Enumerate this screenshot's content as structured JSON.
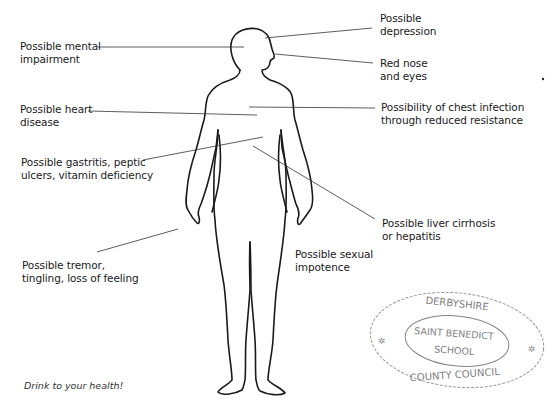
{
  "figure": {
    "line_color": "#1a1a1a",
    "leader_color": "#333333"
  },
  "labels": {
    "mental": [
      "Possible mental",
      "impairment"
    ],
    "depression": [
      "Possible",
      "depression"
    ],
    "nose": [
      "Red nose",
      "and eyes"
    ],
    "heart": [
      "Possible heart",
      "disease"
    ],
    "chest": [
      "Possibility of chest infection",
      "through reduced resistance"
    ],
    "gastritis": [
      "Possible gastritis, peptic",
      "ulcers, vitamin deficiency"
    ],
    "liver": [
      "Possible liver cirrhosis",
      "or hepatitis"
    ],
    "tremor": [
      "Possible tremor,",
      "tingling, loss of feeling"
    ],
    "sexual": [
      "Possible sexual",
      "impotence"
    ]
  },
  "caption": "Drink to your health!",
  "stamp": {
    "top": "DERBYSHIRE",
    "center_line1": "SAINT BENEDICT",
    "center_line2": "SCHOOL",
    "bottom": "COUNTY COUNCIL",
    "color": "#6a6a6a"
  }
}
